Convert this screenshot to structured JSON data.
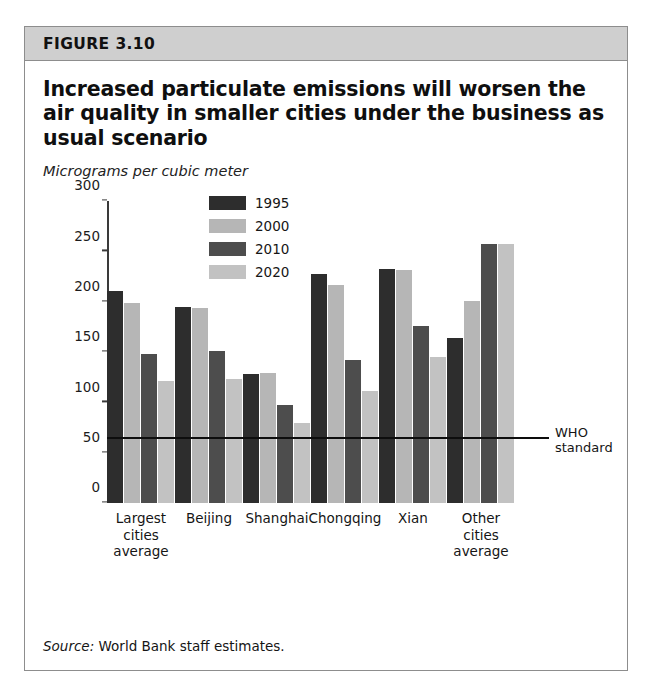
{
  "figure": {
    "number_label": "FIGURE 3.10",
    "title": "Increased particulate emissions will worsen the air quality in smaller cities under the business as usual scenario",
    "subtitle": "Micrograms per cubic meter",
    "source_label": "Source:",
    "source_text": " World Bank staff estimates."
  },
  "colors": {
    "series_1995": "#2d2d2d",
    "series_2000": "#b6b6b6",
    "series_2010": "#4d4d4d",
    "series_2020": "#c2c2c2",
    "band": "#cfcfcf",
    "border": "#8d8d8d",
    "axis": "#3a3a3a",
    "who_line": "#0d0d0d"
  },
  "chart_data": {
    "type": "bar",
    "title": "Increased particulate emissions will worsen the air quality in smaller cities under the business as usual scenario",
    "subtitle": "Micrograms per cubic meter",
    "xlabel": "",
    "ylabel": "Micrograms per cubic meter",
    "ylim": [
      0,
      300
    ],
    "yticks": [
      0,
      50,
      100,
      150,
      200,
      250,
      300
    ],
    "grid": false,
    "legend_position": "inside-top-center",
    "categories": [
      "Largest\ncities\naverage",
      "Beijing",
      "Shanghai",
      "Chongqing",
      "Xian",
      "Other\ncities\naverage"
    ],
    "series": [
      {
        "name": "1995",
        "color": "#2d2d2d",
        "values": [
          211,
          195,
          128,
          228,
          233,
          164
        ]
      },
      {
        "name": "2000",
        "color": "#b6b6b6",
        "values": [
          199,
          194,
          129,
          217,
          232,
          201
        ]
      },
      {
        "name": "2010",
        "color": "#4d4d4d",
        "values": [
          148,
          151,
          98,
          142,
          176,
          257
        ]
      },
      {
        "name": "2020",
        "color": "#c2c2c2",
        "values": [
          121,
          123,
          80,
          111,
          145,
          257
        ]
      }
    ],
    "annotations": [
      {
        "name": "who-standard",
        "label": "WHO\nstandard",
        "type": "hline",
        "value": 65
      }
    ]
  }
}
